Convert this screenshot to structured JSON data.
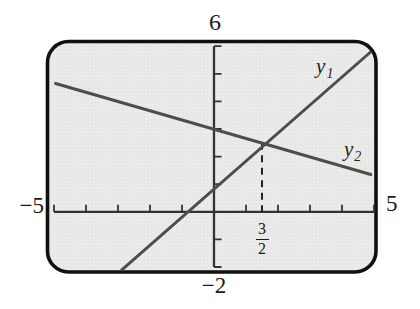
{
  "figure": {
    "window_labels": {
      "top": "6",
      "bottom": "−2",
      "left": "−5",
      "right": "5"
    }
  },
  "chart_data": {
    "type": "line",
    "title": "",
    "xlabel": "",
    "ylabel": "",
    "xlim": [
      -5,
      5
    ],
    "ylim": [
      -2,
      6
    ],
    "grid": false,
    "legend": "none",
    "x_ticks": [
      -5,
      -4,
      -3,
      -2,
      -1,
      1,
      2,
      3,
      4,
      5
    ],
    "y_ticks": [
      -2,
      -1,
      1,
      2,
      3,
      4,
      5,
      6
    ],
    "series": [
      {
        "name": "y1",
        "label": "y",
        "sub": "1",
        "points": [
          [
            -2.88,
            -2.1
          ],
          [
            5.1,
            6.0
          ]
        ],
        "label_pos": [
          3.19,
          5.65
        ]
      },
      {
        "name": "y2",
        "label": "y",
        "sub": "2",
        "points": [
          [
            -4.95,
            4.65
          ],
          [
            4.9,
            1.35
          ]
        ],
        "label_pos": [
          4.06,
          2.64
        ]
      }
    ],
    "intersection": {
      "x": 1.5,
      "y": 2.5,
      "x_label_numerator": "3",
      "x_label_denominator": "2"
    },
    "colors": {
      "border": "#111111",
      "axis": "#333333",
      "line": "#4d4d4d",
      "dashed": "#1a1a1a",
      "screen_base": "#ebebe9",
      "screen_dot": "#d5d5d2",
      "label": "#1a1a1a"
    }
  }
}
